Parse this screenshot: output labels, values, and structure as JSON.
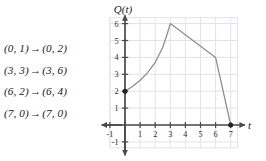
{
  "figure": {
    "mappings": [
      {
        "from": "(0, 1)",
        "arrow": "→",
        "to": "(0, 2)"
      },
      {
        "from": "(3, 3)",
        "arrow": "→",
        "to": "(3, 6)"
      },
      {
        "from": "(6, 2)",
        "arrow": "→",
        "to": "(6, 4)"
      },
      {
        "from": "(7, 0)",
        "arrow": "→",
        "to": "(7, 0)"
      }
    ]
  },
  "chart_data": {
    "type": "line",
    "title": "",
    "xlabel": "t",
    "ylabel": "Q(t)",
    "xlim": [
      -1,
      7.6
    ],
    "ylim": [
      -1,
      6.4
    ],
    "xticks": [
      -1,
      1,
      2,
      3,
      4,
      5,
      6,
      7
    ],
    "yticks": [
      -1,
      1,
      2,
      3,
      4,
      5,
      6
    ],
    "xtick_labels": [
      "-1",
      "1",
      "2",
      "3",
      "4",
      "5",
      "6",
      "7"
    ],
    "ytick_labels": [
      "-1",
      "1",
      "2",
      "3",
      "4",
      "5",
      "6"
    ],
    "grid": true,
    "legend": "none",
    "series": [
      {
        "name": "Q(t)",
        "curve_points": [
          [
            0,
            2
          ],
          [
            0.5,
            2.28
          ],
          [
            1,
            2.65
          ],
          [
            1.5,
            3.1
          ],
          [
            2,
            3.7
          ],
          [
            2.5,
            4.6
          ],
          [
            2.8,
            5.4
          ],
          [
            3,
            6
          ],
          [
            6,
            4
          ],
          [
            7,
            0
          ]
        ],
        "marked_points": [
          [
            0,
            2
          ],
          [
            7,
            0
          ]
        ],
        "color": "#8c8c8c"
      }
    ],
    "colors": {
      "curve": "#8c8c8c",
      "axis": "#4a4a4a",
      "grid": "#e2e2ea",
      "point": "#222222",
      "text": "#1a1a1a"
    }
  }
}
